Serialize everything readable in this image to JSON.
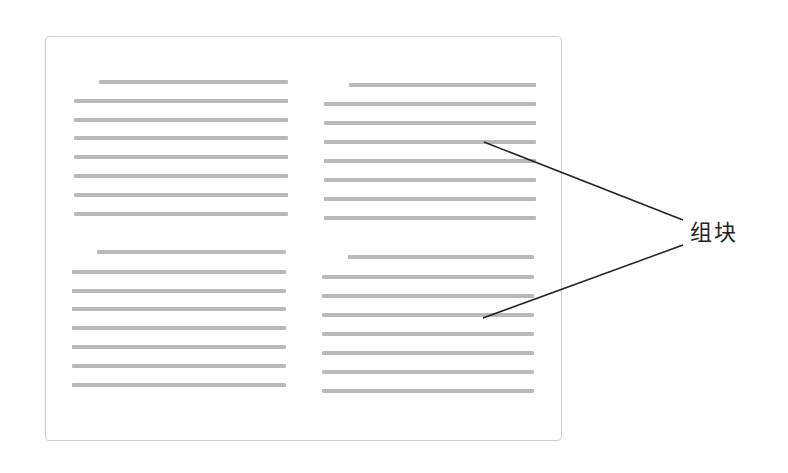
{
  "diagram": {
    "page": {
      "border_color": "#cfcfcf",
      "line_color": "#b9b9b9"
    },
    "blocks": [
      {
        "name": "block-top-left",
        "first_line": {
          "x1": 99,
          "x2": 288,
          "y": 80
        },
        "body_lines": {
          "x1": 74,
          "x2": 288,
          "ys": [
            99,
            118,
            136,
            155,
            174,
            193,
            212
          ]
        }
      },
      {
        "name": "block-top-right",
        "first_line": {
          "x1": 349,
          "x2": 536,
          "y": 83
        },
        "body_lines": {
          "x1": 324,
          "x2": 536,
          "ys": [
            102,
            121,
            140,
            159,
            178,
            197,
            216
          ]
        }
      },
      {
        "name": "block-bottom-left",
        "first_line": {
          "x1": 97,
          "x2": 286,
          "y": 250
        },
        "body_lines": {
          "x1": 72,
          "x2": 286,
          "ys": [
            270,
            289,
            307,
            326,
            345,
            364,
            383
          ]
        }
      },
      {
        "name": "block-bottom-right",
        "first_line": {
          "x1": 348,
          "x2": 534,
          "y": 255
        },
        "body_lines": {
          "x1": 322,
          "x2": 534,
          "ys": [
            275,
            294,
            313,
            332,
            351,
            370,
            389
          ]
        }
      }
    ],
    "callout": {
      "label": "组块",
      "lines": [
        {
          "x1": 484,
          "y1": 142,
          "x2": 683,
          "y2": 220
        },
        {
          "x1": 483,
          "y1": 318,
          "x2": 683,
          "y2": 245
        }
      ],
      "stroke": "#222222"
    }
  }
}
